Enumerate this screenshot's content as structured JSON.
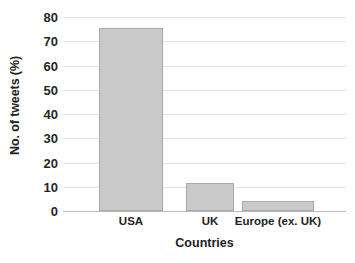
{
  "chart_data": {
    "type": "bar",
    "title": "",
    "subtitle": "",
    "categories": [
      "USA",
      "UK",
      "Europe (ex. UK)"
    ],
    "values": [
      75.5,
      11.7,
      4.0
    ],
    "series": [
      {
        "name": "No. of tweets (%)",
        "values": [
          75.5,
          11.7,
          4.0
        ]
      }
    ],
    "xlabel": "Countries",
    "ylabel": "No. of tweets (%)",
    "ylim": [
      0,
      80
    ],
    "yticks": [
      0,
      10,
      20,
      30,
      40,
      50,
      60,
      70,
      80
    ],
    "ytick_labels": [
      "0",
      "10",
      "20",
      "30",
      "40",
      "50",
      "60",
      "70",
      "80"
    ],
    "grid": "horizontal",
    "legend": "none",
    "bar_color": "#c9c9c9",
    "bar_edge_color": "#a9a9a9",
    "gridline_color": "#e2e2e2",
    "axis_line_color": "#bdbdbd",
    "background": "#ffffff",
    "annotations": []
  }
}
